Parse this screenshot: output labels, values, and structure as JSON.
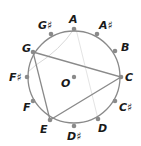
{
  "diagram": {
    "center": {
      "label": "O",
      "x": 74,
      "y": 77
    },
    "radius": 46,
    "colors": {
      "circle": "#8a8a8a",
      "point": "#8a8a8a",
      "triangle": "#8a8a8a",
      "faint": "#d8d8d8",
      "label": "#1a1a1a"
    },
    "points": [
      {
        "label": "A",
        "x": 74,
        "y": 29,
        "lx": 69,
        "ly": 23
      },
      {
        "label": "A♯",
        "x": 97,
        "y": 34,
        "lx": 99,
        "ly": 29
      },
      {
        "label": "B",
        "x": 115,
        "y": 51,
        "lx": 121,
        "ly": 51
      },
      {
        "label": "C",
        "x": 121,
        "y": 77,
        "lx": 125,
        "ly": 81
      },
      {
        "label": "C♯",
        "x": 115,
        "y": 101,
        "lx": 119,
        "ly": 111
      },
      {
        "label": "D",
        "x": 98,
        "y": 119,
        "lx": 98,
        "ly": 132
      },
      {
        "label": "D♯",
        "x": 74,
        "y": 126,
        "lx": 67,
        "ly": 140
      },
      {
        "label": "E",
        "x": 50,
        "y": 120,
        "lx": 40,
        "ly": 133
      },
      {
        "label": "F",
        "x": 33,
        "y": 101,
        "lx": 23,
        "ly": 111
      },
      {
        "label": "F♯",
        "x": 27,
        "y": 77,
        "lx": 9,
        "ly": 81
      },
      {
        "label": "G",
        "x": 33,
        "y": 52,
        "lx": 22,
        "ly": 52
      },
      {
        "label": "G♯",
        "x": 51,
        "y": 34,
        "lx": 38,
        "ly": 29
      }
    ],
    "triangle": [
      "G",
      "C",
      "E"
    ],
    "o_label": {
      "text": "O",
      "x": 61,
      "y": 87
    }
  }
}
